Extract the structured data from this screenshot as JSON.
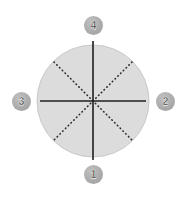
{
  "canvas": {
    "width": 185,
    "height": 197,
    "background": "#ffffff"
  },
  "figure": {
    "type": "quadrant-circle-diagram",
    "circle": {
      "center_x": 93,
      "center_y": 101,
      "radius": 56,
      "fill": "#dcdcdc",
      "stroke": "#c9c9c9"
    },
    "axes": {
      "style": "solid",
      "color": "#1f1f1f",
      "width": 1.6,
      "vertical": {
        "x": 93,
        "y1": 41,
        "y2": 160
      },
      "horizontal": {
        "y": 101,
        "x1": 40,
        "x2": 146
      }
    },
    "diagonals": {
      "style": "dotted",
      "color": "#2a2a2a",
      "width": 1.6,
      "dash": "0.5 3.4",
      "lines": [
        {
          "name": "diagonal-nw-se",
          "x1": 54,
          "y1": 62,
          "x2": 132,
          "y2": 140
        },
        {
          "name": "diagonal-ne-sw",
          "x1": 132,
          "y1": 62,
          "x2": 54,
          "y2": 140
        }
      ]
    }
  },
  "badges": {
    "color": "#a9a9a9",
    "text_color": "#2b2b2b",
    "top": {
      "label": "4",
      "x": 93,
      "y": 25
    },
    "right": {
      "label": "2",
      "x": 165,
      "y": 101
    },
    "left": {
      "label": "3",
      "x": 21,
      "y": 101
    },
    "bottom": {
      "label": "1",
      "x": 93,
      "y": 174
    }
  }
}
